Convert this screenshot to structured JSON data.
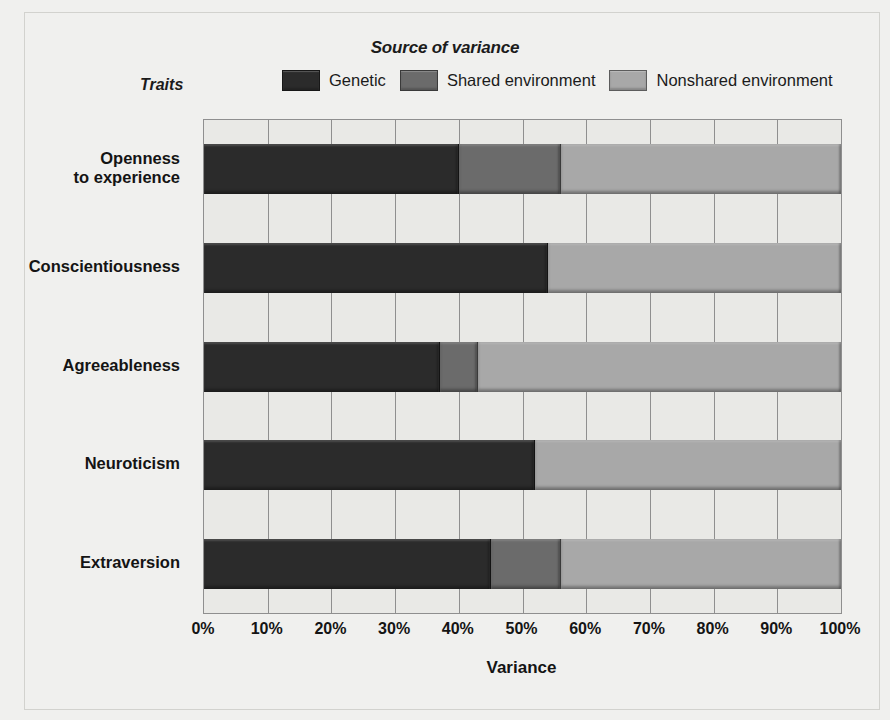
{
  "header": {
    "source_title": "Source of variance",
    "traits_axis_title": "Traits"
  },
  "legend": {
    "items": [
      {
        "label": "Genetic",
        "color": "#2b2b2b",
        "key": "genetic"
      },
      {
        "label": "Shared environment",
        "color": "#6b6b6b",
        "key": "shared"
      },
      {
        "label": "Nonshared environment",
        "color": "#a8a8a8",
        "key": "nonshared"
      }
    ]
  },
  "axes": {
    "x_title": "Variance",
    "x_ticks": [
      "0%",
      "10%",
      "20%",
      "30%",
      "40%",
      "50%",
      "60%",
      "70%",
      "80%",
      "90%",
      "100%"
    ]
  },
  "chart_data": {
    "type": "bar",
    "orientation": "horizontal",
    "stacked": true,
    "title": "Source of variance",
    "xlabel": "Variance",
    "ylabel": "Traits",
    "xlim": [
      0,
      100
    ],
    "xtick_values": [
      0,
      10,
      20,
      30,
      40,
      50,
      60,
      70,
      80,
      90,
      100
    ],
    "xtick_labels": [
      "0%",
      "10%",
      "20%",
      "30%",
      "40%",
      "50%",
      "60%",
      "70%",
      "80%",
      "90%",
      "100%"
    ],
    "grid": true,
    "legend_position": "top",
    "categories": [
      "Openness to experience",
      "Conscientiousness",
      "Agreeableness",
      "Neuroticism",
      "Extraversion"
    ],
    "category_lines": [
      [
        "Openness",
        "to experience"
      ],
      [
        "Conscientiousness"
      ],
      [
        "Agreeableness"
      ],
      [
        "Neuroticism"
      ],
      [
        "Extraversion"
      ]
    ],
    "series": [
      {
        "name": "Genetic",
        "color": "#2b2b2b",
        "values": [
          40,
          54,
          37,
          52,
          45
        ]
      },
      {
        "name": "Shared environment",
        "color": "#6b6b6b",
        "values": [
          16,
          0,
          6,
          0,
          11
        ]
      },
      {
        "name": "Nonshared environment",
        "color": "#a8a8a8",
        "values": [
          44,
          46,
          57,
          48,
          44
        ]
      }
    ]
  }
}
